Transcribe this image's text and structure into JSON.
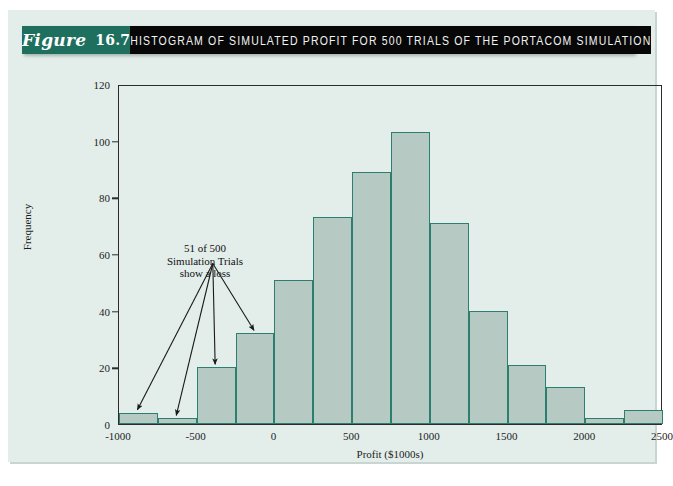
{
  "figure": {
    "word": "Figure",
    "number": "16.7",
    "title": "HISTOGRAM OF SIMULATED PROFIT FOR 500 TRIALS OF THE PORTACOM SIMULATION"
  },
  "colors": {
    "banner_teal": "#1f6f5e",
    "banner_black": "#070707",
    "page_bg": "#e3edea",
    "bar_fill": "#b6c9c2",
    "bar_border": "#2c7f6e",
    "axis": "#2c2c2c"
  },
  "annotation": {
    "line1": "51 of 500",
    "line2": "Simulation Trials",
    "line3": "show a loss"
  },
  "chart_data": {
    "type": "bar",
    "title": "HISTOGRAM OF SIMULATED PROFIT FOR 500 TRIALS OF THE PORTACOM SIMULATION",
    "xlabel": "Profit ($1000s)",
    "ylabel": "Frequency",
    "xlim": [
      -1000,
      2500
    ],
    "ylim": [
      0,
      120
    ],
    "bin_width": 250,
    "grid": false,
    "legend": null,
    "xticks": [
      -1000,
      -500,
      0,
      500,
      1000,
      1500,
      2000,
      2500
    ],
    "xtick_labels": [
      "-1000",
      "-500",
      "0",
      "500",
      "1000",
      "1500",
      "2000",
      "2500"
    ],
    "yticks": [
      0,
      20,
      40,
      60,
      80,
      100,
      120
    ],
    "ytick_labels": [
      "0",
      "20",
      "40",
      "60",
      "80",
      "100",
      "120"
    ],
    "bin_edges": [
      -1000,
      -750,
      -500,
      -250,
      0,
      250,
      500,
      750,
      1000,
      1250,
      1500,
      1750,
      2000,
      2250,
      2500
    ],
    "bin_centers": [
      -875,
      -625,
      -375,
      -125,
      125,
      375,
      625,
      875,
      1125,
      1375,
      1625,
      1875,
      2125,
      2375
    ],
    "values": [
      4,
      2,
      20,
      32,
      51,
      73,
      89,
      103,
      71,
      40,
      21,
      13,
      2,
      5
    ],
    "total_trials": 500,
    "annotations": [
      {
        "text": "51 of 500 Simulation Trials show a loss",
        "points_to_bins": [
          0,
          1,
          2,
          3
        ]
      }
    ]
  }
}
